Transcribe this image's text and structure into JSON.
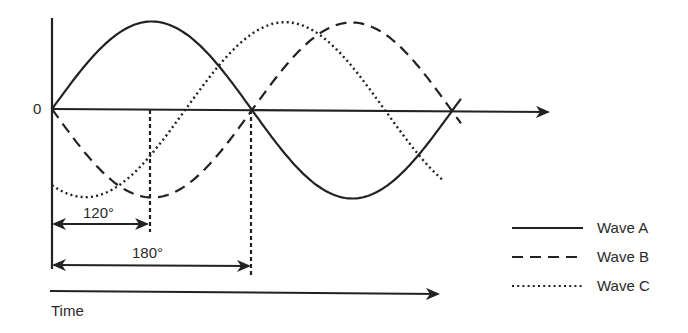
{
  "diagram": {
    "title": "",
    "origin_label": "0",
    "time_label": "Time",
    "angle_labels": {
      "first": "120°",
      "second": "180°"
    },
    "colors": {
      "ink": "#222222",
      "background": "#ffffff"
    }
  },
  "legend": [
    {
      "label": "Wave A",
      "style": "solid"
    },
    {
      "label": "Wave B",
      "style": "dashed"
    },
    {
      "label": "Wave C",
      "style": "dotted"
    }
  ],
  "chart_data": {
    "type": "line",
    "title": "",
    "xlabel": "Time",
    "ylabel": "",
    "x_unit": "degrees",
    "x_range": [
      0,
      370
    ],
    "y_range": [
      -1,
      1
    ],
    "annotations": [
      {
        "text": "0",
        "at": "origin"
      },
      {
        "text": "120°",
        "type": "interval",
        "from": 0,
        "to": 120
      },
      {
        "text": "180°",
        "type": "interval",
        "from": 0,
        "to": 180
      }
    ],
    "series": [
      {
        "name": "Wave A",
        "style": "solid",
        "phase_deg": 0,
        "formula": "sin(x)"
      },
      {
        "name": "Wave B",
        "style": "dashed",
        "phase_deg": 180,
        "formula": "-sin(x)"
      },
      {
        "name": "Wave C",
        "style": "dotted",
        "phase_deg": -120,
        "formula": "sin(x-120)"
      }
    ],
    "legend_position": "bottom-right",
    "grid": false
  }
}
